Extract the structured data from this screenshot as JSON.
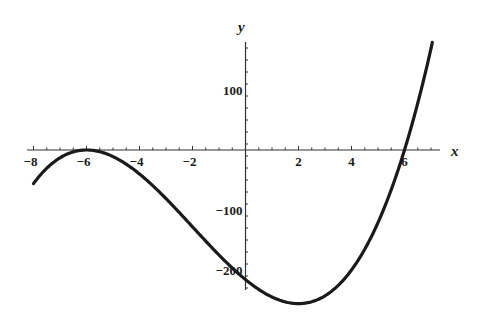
{
  "chart_data": {
    "type": "line",
    "title": "",
    "xlabel": "x",
    "ylabel": "y",
    "function": "y = (x + 6)^2 (x - 6)",
    "xlim": [
      -8,
      7
    ],
    "ylim": [
      -256,
      169
    ],
    "grid": false,
    "legend": "none",
    "x_ticks": [
      -8,
      -6,
      -4,
      -2,
      2,
      4,
      6
    ],
    "x_tick_labels": [
      "−8",
      "−6",
      "−4",
      "−2",
      "2",
      "4",
      "6"
    ],
    "x_minor_step": 0.5,
    "y_ticks": [
      100,
      -100,
      -200
    ],
    "y_tick_labels": [
      "100",
      "−100",
      "−200"
    ],
    "y_minor_step": 20,
    "x": [
      -8,
      -7,
      -6,
      -5,
      -4,
      -3,
      -2,
      -1,
      0,
      1,
      2,
      3,
      4,
      5,
      6,
      7
    ],
    "series": [
      {
        "name": "f(x)",
        "values": [
          -56,
          -13,
          0,
          -11,
          -40,
          -81,
          -128,
          -175,
          -216,
          -245,
          -256,
          -243,
          -200,
          -121,
          0,
          169
        ]
      }
    ],
    "key_points": {
      "local_max": [
        -6,
        0
      ],
      "local_min": [
        2,
        -256
      ],
      "roots": [
        -6,
        6
      ],
      "y_intercept": -216
    }
  },
  "colors": {
    "curve": "#1a1a1a",
    "axes": "#333333",
    "background": "#ffffff"
  }
}
